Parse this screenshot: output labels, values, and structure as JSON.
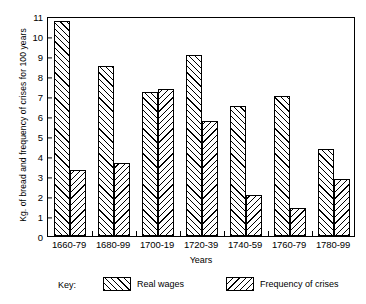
{
  "chart_data": {
    "type": "bar",
    "title": "",
    "xlabel": "Years",
    "ylabel": "Kg. of bread and frequency of crises for 100 years",
    "categories": [
      "1660-79",
      "1680-99",
      "1700-19",
      "1720-39",
      "1740-59",
      "1760-79",
      "1780-99"
    ],
    "series": [
      {
        "name": "Real wages",
        "values": [
          10.75,
          8.5,
          7.2,
          9.05,
          6.5,
          7.0,
          4.35
        ]
      },
      {
        "name": "Frequency of crises",
        "values": [
          3.3,
          3.65,
          7.35,
          5.75,
          2.05,
          1.4,
          2.85
        ]
      }
    ],
    "ylim": [
      0,
      11
    ],
    "yticks": [
      0,
      1,
      2,
      3,
      4,
      5,
      6,
      7,
      8,
      9,
      10,
      11
    ],
    "grid": false,
    "legend_position": "bottom",
    "legend_prefix": "Key:"
  }
}
